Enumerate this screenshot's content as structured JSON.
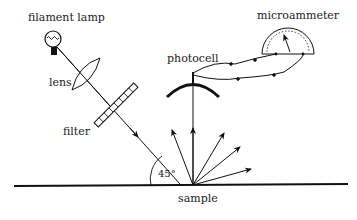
{
  "diagram": {
    "labels": {
      "filament_lamp": "filament lamp",
      "lens": "lens",
      "filter": "filter",
      "photocell": "photocell",
      "microammeter": "microammeter",
      "sample": "sample",
      "angle": "45°"
    },
    "colors": {
      "ink": "#111111",
      "background": "#ffffff"
    }
  }
}
